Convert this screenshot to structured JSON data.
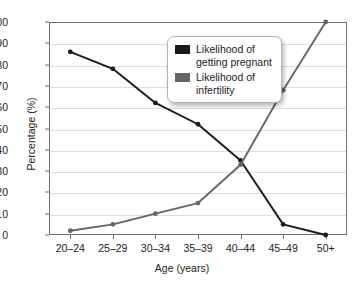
{
  "figure": {
    "top_crop_sliver": "᠎"
  },
  "chart_data": {
    "type": "line",
    "title": "",
    "xlabel": "Age (years)",
    "ylabel": "Percentage (%)",
    "categories": [
      "20–24",
      "25–29",
      "30–34",
      "35–39",
      "40–44",
      "45–49",
      "50+"
    ],
    "ylim": [
      0,
      100
    ],
    "yticks": [
      0,
      10,
      20,
      30,
      40,
      50,
      60,
      70,
      80,
      90,
      100
    ],
    "ytick_labels": [
      "0",
      "10",
      "20",
      "30",
      "40",
      "50",
      "60",
      "70",
      "80",
      "90",
      "100"
    ],
    "grid": "horizontal",
    "legend_position": "upper-center-inside",
    "series": [
      {
        "name": "Likelihood of getting pregnant",
        "legend_label": "Likelihood of\ngetting pregnant",
        "color": "#1a1a1a",
        "marker": "circle",
        "values": [
          86,
          78,
          62,
          52,
          35,
          5,
          0
        ]
      },
      {
        "name": "Likelihood of infertility",
        "legend_label": "Likelihood of\ninfertility",
        "color": "#666666",
        "marker": "circle",
        "values": [
          2,
          5,
          10,
          15,
          33,
          68,
          100
        ]
      }
    ]
  },
  "axis_colors": {
    "frame": "#6f6f6f",
    "gridline": "#dedede",
    "text": "#1d1d1d"
  }
}
